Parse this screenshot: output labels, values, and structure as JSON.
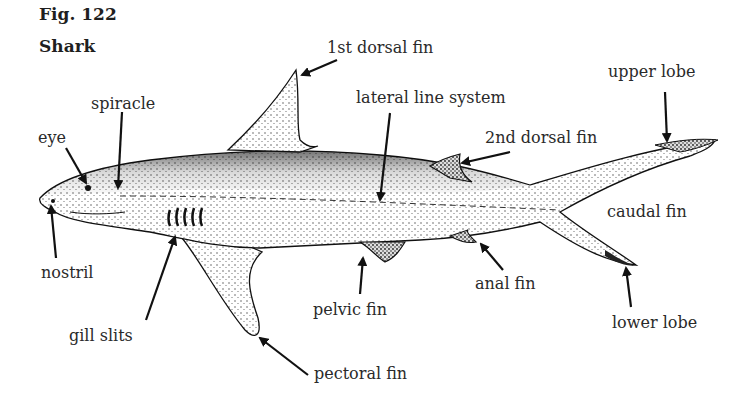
{
  "figure": {
    "number": "Fig. 122",
    "title": "Shark"
  },
  "labels": {
    "first_dorsal_fin": "1st dorsal fin",
    "spiracle": "spiracle",
    "lateral_line_system": "lateral line system",
    "upper_lobe": "upper lobe",
    "eye": "eye",
    "second_dorsal_fin": "2nd dorsal fin",
    "caudal_fin": "caudal fin",
    "nostril": "nostril",
    "anal_fin": "anal fin",
    "pelvic_fin": "pelvic fin",
    "lower_lobe": "lower lobe",
    "gill_slits": "gill slits",
    "pectoral_fin": "pectoral fin"
  }
}
